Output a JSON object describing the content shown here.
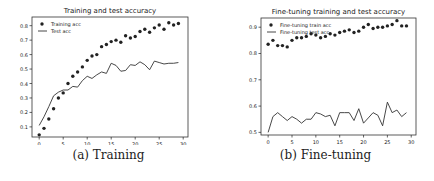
{
  "chart_data": [
    {
      "type": "scatter+line",
      "title": "Training and test accuracy",
      "caption": "(a) Training",
      "xlabel": "",
      "ylabel": "",
      "xlim": [
        -1.5,
        31
      ],
      "ylim": [
        0.03,
        0.86
      ],
      "xticks": [
        0,
        5,
        10,
        15,
        20,
        25,
        30
      ],
      "yticks": [
        0.1,
        0.2,
        0.3,
        0.4,
        0.5,
        0.6,
        0.7,
        0.8
      ],
      "legend_position": "upper left",
      "grid": false,
      "x": [
        0,
        1,
        2,
        3,
        4,
        5,
        6,
        7,
        8,
        9,
        10,
        11,
        12,
        13,
        14,
        15,
        16,
        17,
        18,
        19,
        20,
        21,
        22,
        23,
        24,
        25,
        26,
        27,
        28,
        29
      ],
      "series": [
        {
          "name": "Training acc",
          "style": "dots",
          "values": [
            0.045,
            0.09,
            0.155,
            0.225,
            0.3,
            0.335,
            0.4,
            0.45,
            0.48,
            0.515,
            0.56,
            0.59,
            0.6,
            0.655,
            0.67,
            0.69,
            0.7,
            0.685,
            0.73,
            0.715,
            0.725,
            0.76,
            0.775,
            0.755,
            0.785,
            0.805,
            0.775,
            0.82,
            0.805,
            0.815
          ]
        },
        {
          "name": "Test acc",
          "style": "line",
          "values": [
            0.11,
            0.17,
            0.24,
            0.315,
            0.34,
            0.355,
            0.355,
            0.38,
            0.375,
            0.42,
            0.45,
            0.435,
            0.46,
            0.48,
            0.47,
            0.54,
            0.525,
            0.485,
            0.49,
            0.53,
            0.525,
            0.55,
            0.53,
            0.495,
            0.555,
            0.545,
            0.535,
            0.54,
            0.54,
            0.545
          ]
        }
      ]
    },
    {
      "type": "scatter+line",
      "title": "Fine-tuning training and test accuracy",
      "caption": "(b) Fine-tuning",
      "xlabel": "",
      "ylabel": "",
      "xlim": [
        -1.5,
        31
      ],
      "ylim": [
        0.49,
        0.935
      ],
      "xticks": [
        0,
        5,
        10,
        15,
        20,
        25,
        30
      ],
      "yticks": [
        0.5,
        0.6,
        0.7,
        0.8,
        0.9
      ],
      "legend_position": "upper left",
      "grid": false,
      "x": [
        0,
        1,
        2,
        3,
        4,
        5,
        6,
        7,
        8,
        9,
        10,
        11,
        12,
        13,
        14,
        15,
        16,
        17,
        18,
        19,
        20,
        21,
        22,
        23,
        24,
        25,
        26,
        27,
        28,
        29
      ],
      "series": [
        {
          "name": "Fine-tuning train acc",
          "style": "dots",
          "values": [
            0.835,
            0.85,
            0.83,
            0.83,
            0.825,
            0.85,
            0.86,
            0.86,
            0.865,
            0.875,
            0.87,
            0.86,
            0.865,
            0.875,
            0.87,
            0.88,
            0.885,
            0.89,
            0.88,
            0.885,
            0.9,
            0.91,
            0.895,
            0.9,
            0.9,
            0.905,
            0.91,
            0.925,
            0.905,
            0.905
          ]
        },
        {
          "name": "Fine-tuning test acc",
          "style": "line",
          "values": [
            0.5,
            0.56,
            0.575,
            0.56,
            0.545,
            0.56,
            0.55,
            0.535,
            0.55,
            0.55,
            0.575,
            0.57,
            0.56,
            0.565,
            0.525,
            0.575,
            0.575,
            0.575,
            0.545,
            0.59,
            0.535,
            0.555,
            0.575,
            0.565,
            0.525,
            0.615,
            0.575,
            0.585,
            0.56,
            0.575
          ]
        }
      ]
    }
  ],
  "captions": {
    "left": "(a) Training",
    "right": "(b) Fine-tuning"
  },
  "colors": {
    "ink": "#222222",
    "frame": "#333333",
    "background": "#ffffff"
  }
}
